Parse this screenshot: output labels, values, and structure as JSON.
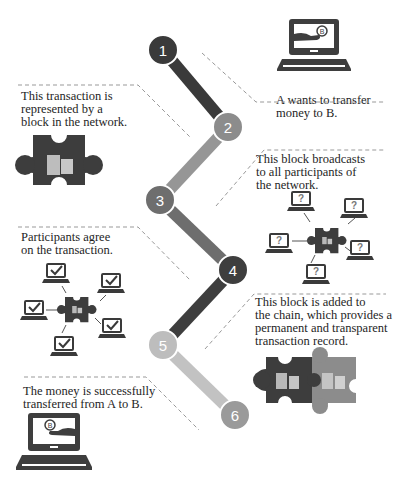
{
  "steps": [
    {
      "number": "1",
      "text": "A wants to transfer money to B.",
      "lines": [
        "A wants to transfer",
        "money to B."
      ],
      "color": "#3a3a3a"
    },
    {
      "number": "2",
      "text": "This transaction is represented by a block in the network.",
      "lines": [
        "This transaction is",
        "represented by a",
        "block in the network."
      ],
      "color": "#8c8c8c"
    },
    {
      "number": "3",
      "text": "This block broadcasts to all participants of the network.",
      "lines": [
        "This block broadcasts",
        "to all participants of",
        "the network."
      ],
      "color": "#6e6e6e"
    },
    {
      "number": "4",
      "text": "Participants agree on the transaction.",
      "lines": [
        "Participants agree",
        "on the transaction."
      ],
      "color": "#3e3e3e"
    },
    {
      "number": "5",
      "text": "This block is added to the chain, which provides a permanent and transparent transaction record.",
      "lines": [
        "This block is added to",
        "the chain, which provides a",
        "permanent and transparent",
        "transaction record."
      ],
      "color": "#bdbdbd"
    },
    {
      "number": "6",
      "text": "The money is successfully transferred from A to B.",
      "lines": [
        "The money is successfully",
        "transferred from A to B."
      ],
      "color": "#9a9a9a"
    }
  ],
  "icons": {
    "unknown_mark": "?",
    "currency_mark": "B"
  },
  "colors": {
    "dark": "#3d3d3d",
    "mid": "#8a8a8a",
    "light": "#bcbcbc",
    "block": "#c9c9c9"
  }
}
